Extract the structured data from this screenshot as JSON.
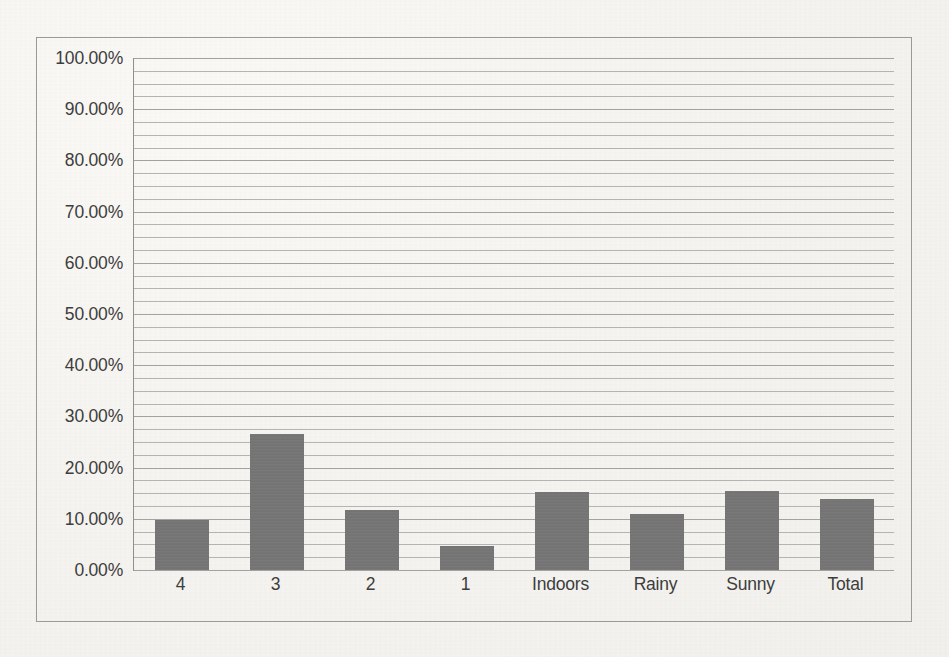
{
  "chart_data": {
    "type": "bar",
    "title": "",
    "subtitle": "",
    "xlabel": "",
    "ylabel": "",
    "categories": [
      "4",
      "3",
      "2",
      "1",
      "Indoors",
      "Rainy",
      "Sunny",
      "Total"
    ],
    "values": [
      9.8,
      26.5,
      11.8,
      4.7,
      15.3,
      11.0,
      15.5,
      13.9
    ],
    "value_labels": [
      "9.80%",
      "26.50%",
      "11.80%",
      "4.70%",
      "15.30%",
      "11.00%",
      "15.50%",
      "13.90%"
    ],
    "ylim": [
      0,
      100
    ],
    "y_tick_values": [
      0,
      10,
      20,
      30,
      40,
      50,
      60,
      70,
      80,
      90,
      100
    ],
    "y_tick_labels": [
      "0.00%",
      "10.00%",
      "20.00%",
      "30.00%",
      "40.00%",
      "50.00%",
      "60.00%",
      "70.00%",
      "80.00%",
      "90.00%",
      "100.00%"
    ],
    "gridline_interval": 2.5,
    "grid": true,
    "legend": false,
    "legend_position": "none",
    "series": [
      {
        "name": "",
        "values": [
          9.8,
          26.5,
          11.8,
          4.7,
          15.3,
          11.0,
          15.5,
          13.9
        ]
      }
    ],
    "colors": {
      "bar": "#757575",
      "gridline": "#b4b4b1",
      "axis": "#8f8f8c",
      "frame": "#9a9a97",
      "text": "#3d3d3d",
      "background": "#f6f5f1"
    }
  }
}
